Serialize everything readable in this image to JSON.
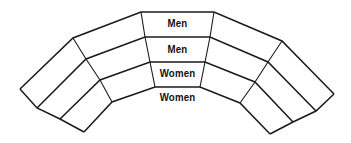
{
  "diagram": {
    "type": "curved-seating-rows",
    "rows": [
      {
        "label": "Men"
      },
      {
        "label": "Men"
      },
      {
        "label": "Women"
      },
      {
        "label": "Women"
      }
    ],
    "colors": {
      "stroke": "#1a1a1a",
      "text": "#111111",
      "background": "#ffffff"
    }
  }
}
